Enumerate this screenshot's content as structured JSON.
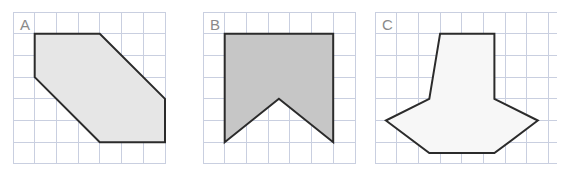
{
  "figure": {
    "title": "",
    "background_color": "#ffffff",
    "grid_color": "#c9cfe0",
    "outline_color": "#2b2b2b",
    "label_color": "#8a8a8a",
    "cell_size_px": 21.7
  },
  "panels": [
    {
      "id": "panel-a",
      "label": "A",
      "label_cell": {
        "col": 0,
        "row": 0
      },
      "origin": {
        "x": 13,
        "y": 12
      },
      "grid": {
        "cols": 7,
        "rows": 7
      },
      "shape": {
        "name": "slanted-hexagon",
        "fill": "#e6e6e6",
        "fill_opacity": 1,
        "vertices_cells": [
          [
            1,
            1
          ],
          [
            4,
            1
          ],
          [
            7,
            4
          ],
          [
            7,
            6
          ],
          [
            4,
            6
          ],
          [
            1,
            3
          ]
        ],
        "points_px": "34.7,33.7 99.8,33.7 165,98.8 165,142.2 99.8,142.2 34.7,77.1"
      }
    },
    {
      "id": "panel-b",
      "label": "B",
      "label_cell": {
        "col": 0,
        "row": 0
      },
      "origin": {
        "x": 203,
        "y": 12
      },
      "grid": {
        "cols": 7,
        "rows": 7
      },
      "shape": {
        "name": "banner-flag-notched",
        "fill": "#c6c6c6",
        "fill_opacity": 1,
        "vertices_cells": [
          [
            1,
            1
          ],
          [
            6,
            1
          ],
          [
            6,
            6
          ],
          [
            3.5,
            4
          ],
          [
            1,
            6
          ]
        ],
        "points_px": "224.7,33.7 333.2,33.7 333.2,142.2 278.9,98.8 224.7,142.2"
      }
    },
    {
      "id": "panel-c",
      "label": "C",
      "label_cell": {
        "col": 0,
        "row": 0
      },
      "origin": {
        "x": 375,
        "y": 12
      },
      "grid": {
        "cols": 8,
        "rows": 7
      },
      "shape": {
        "name": "house-gem-octagon",
        "fill": "#f7f7f7",
        "fill_opacity": 1,
        "vertices_cells": [
          [
            3,
            1
          ],
          [
            5.5,
            1
          ],
          [
            5.5,
            4
          ],
          [
            7.5,
            5
          ],
          [
            5.5,
            6.5
          ],
          [
            2.5,
            6.5
          ],
          [
            0.5,
            5
          ],
          [
            2.5,
            4
          ]
        ],
        "points_px": "440.1,33.7 494.4,33.7 494.4,98.8 537.8,120.5 494.4,153.1 429.3,153.1 385.9,120.5 429.3,98.8"
      }
    }
  ]
}
